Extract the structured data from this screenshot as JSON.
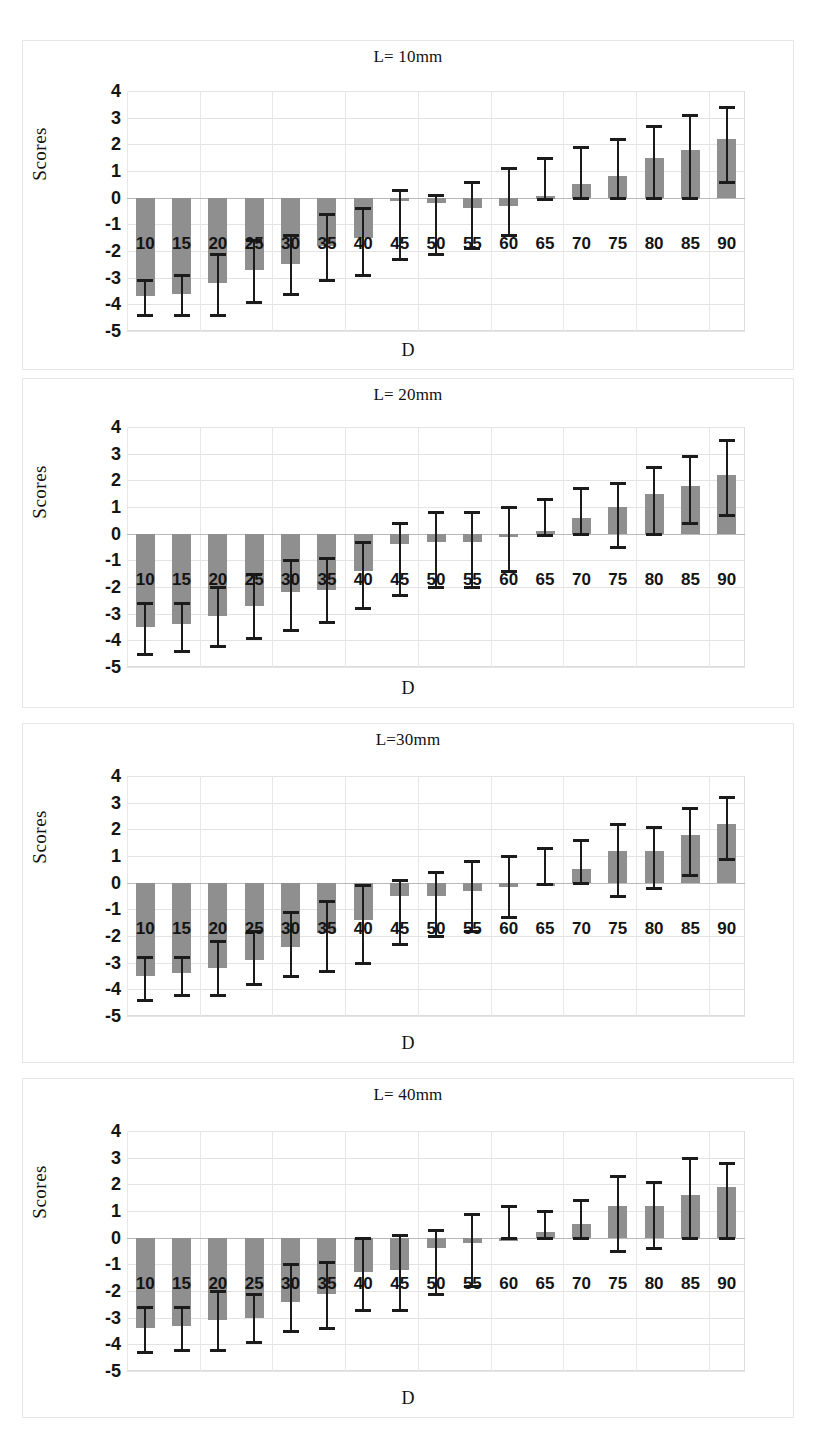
{
  "figure": {
    "panel_count": 4,
    "bar_color": "#8f8f8f",
    "whisker_color": "#1b1b1b",
    "grid_color": "#e3e3e3"
  },
  "chart_data": [
    {
      "type": "bar",
      "title": "L= 10mm",
      "xlabel": "D",
      "ylabel": "Scores",
      "ylim": [
        -5,
        4
      ],
      "yticks": [
        "4",
        "3",
        "2",
        "1",
        "0",
        "-1",
        "-2",
        "-3",
        "-4",
        "-5"
      ],
      "grid": true,
      "legend": "none",
      "categories": [
        "10",
        "15",
        "20",
        "25",
        "30",
        "35",
        "40",
        "45",
        "50",
        "55",
        "60",
        "65",
        "70",
        "75",
        "80",
        "85",
        "90"
      ],
      "values": [
        -3.7,
        -3.6,
        -3.2,
        -2.7,
        -2.5,
        -1.8,
        -1.5,
        -0.1,
        -0.2,
        -0.4,
        -0.3,
        0.05,
        0.5,
        0.8,
        1.5,
        1.8,
        2.2
      ],
      "err_low": [
        -4.4,
        -4.4,
        -4.4,
        -3.9,
        -3.6,
        -3.1,
        -2.9,
        -2.3,
        -2.1,
        -1.9,
        -1.4,
        -0.05,
        0.0,
        0.0,
        0.0,
        0.0,
        0.6
      ],
      "err_high": [
        -3.1,
        -2.9,
        -2.1,
        -1.6,
        -1.4,
        -0.6,
        -0.4,
        0.3,
        0.1,
        0.6,
        1.1,
        1.5,
        1.9,
        2.2,
        2.7,
        3.1,
        3.4
      ]
    },
    {
      "type": "bar",
      "title": "L= 20mm",
      "xlabel": "D",
      "ylabel": "Scores",
      "ylim": [
        -5,
        4
      ],
      "yticks": [
        "4",
        "3",
        "2",
        "1",
        "0",
        "-1",
        "-2",
        "-3",
        "-4",
        "-5"
      ],
      "grid": true,
      "legend": "none",
      "categories": [
        "10",
        "15",
        "20",
        "25",
        "30",
        "35",
        "40",
        "45",
        "50",
        "55",
        "60",
        "65",
        "70",
        "75",
        "80",
        "85",
        "90"
      ],
      "values": [
        -3.5,
        -3.4,
        -3.1,
        -2.7,
        -2.2,
        -2.1,
        -1.4,
        -0.4,
        -0.3,
        -0.3,
        -0.05,
        0.1,
        0.6,
        1.0,
        1.5,
        1.8,
        2.2
      ],
      "err_low": [
        -4.5,
        -4.4,
        -4.2,
        -3.9,
        -3.6,
        -3.3,
        -2.8,
        -2.3,
        -2.0,
        -2.0,
        -1.4,
        -0.05,
        0.0,
        -0.5,
        0.0,
        0.4,
        0.7
      ],
      "err_high": [
        -2.6,
        -2.6,
        -2.0,
        -1.5,
        -1.0,
        -0.9,
        -0.3,
        0.4,
        0.8,
        0.8,
        1.0,
        1.3,
        1.7,
        1.9,
        2.5,
        2.9,
        3.5
      ]
    },
    {
      "type": "bar",
      "title": "L=30mm",
      "xlabel": "D",
      "ylabel": "Scores",
      "ylim": [
        -5,
        4
      ],
      "yticks": [
        "4",
        "3",
        "2",
        "1",
        "0",
        "-1",
        "-2",
        "-3",
        "-4",
        "-5"
      ],
      "grid": true,
      "legend": "none",
      "categories": [
        "10",
        "15",
        "20",
        "25",
        "30",
        "35",
        "40",
        "45",
        "50",
        "55",
        "60",
        "65",
        "70",
        "75",
        "80",
        "85",
        "90"
      ],
      "values": [
        -3.5,
        -3.4,
        -3.2,
        -2.9,
        -2.4,
        -1.9,
        -1.4,
        -0.5,
        -0.5,
        -0.3,
        -0.15,
        0.0,
        0.5,
        1.2,
        1.2,
        1.8,
        2.2
      ],
      "err_low": [
        -4.4,
        -4.2,
        -4.2,
        -3.8,
        -3.5,
        -3.3,
        -3.0,
        -2.3,
        -2.0,
        -1.8,
        -1.3,
        -0.05,
        0.0,
        -0.5,
        -0.2,
        0.3,
        0.9
      ],
      "err_high": [
        -2.8,
        -2.8,
        -2.2,
        -1.8,
        -1.1,
        -0.7,
        -0.1,
        0.1,
        0.4,
        0.8,
        1.0,
        1.3,
        1.6,
        2.2,
        2.1,
        2.8,
        3.2
      ]
    },
    {
      "type": "bar",
      "title": "L= 40mm",
      "xlabel": "D",
      "ylabel": "Scores",
      "ylim": [
        -5,
        4
      ],
      "yticks": [
        "4",
        "3",
        "2",
        "1",
        "0",
        "-1",
        "-2",
        "-3",
        "-4",
        "-5"
      ],
      "grid": true,
      "legend": "none",
      "categories": [
        "10",
        "15",
        "20",
        "25",
        "30",
        "35",
        "40",
        "45",
        "50",
        "55",
        "60",
        "65",
        "70",
        "75",
        "80",
        "85",
        "90"
      ],
      "values": [
        -3.4,
        -3.3,
        -3.1,
        -3.0,
        -2.4,
        -2.1,
        -1.3,
        -1.2,
        -0.4,
        -0.2,
        0.0,
        0.2,
        0.5,
        1.2,
        1.2,
        1.6,
        1.9
      ],
      "err_low": [
        -4.3,
        -4.2,
        -4.2,
        -3.9,
        -3.5,
        -3.4,
        -2.7,
        -2.7,
        -2.1,
        -1.8,
        0.0,
        0.0,
        0.0,
        -0.5,
        -0.4,
        0.0,
        0.0
      ],
      "err_high": [
        -2.6,
        -2.6,
        -2.0,
        -2.1,
        -1.0,
        -0.9,
        0.0,
        0.1,
        0.3,
        0.9,
        1.2,
        1.0,
        1.4,
        2.3,
        2.1,
        3.0,
        2.8
      ]
    }
  ]
}
